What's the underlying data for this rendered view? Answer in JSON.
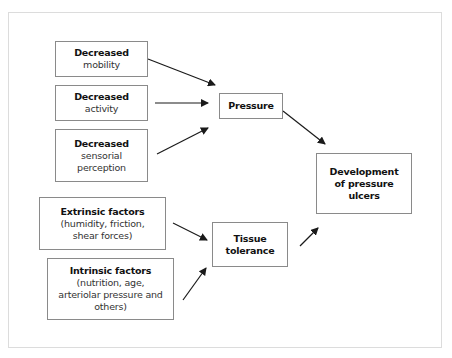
{
  "diagram": {
    "type": "flowchart",
    "title": "",
    "nodes": [
      {
        "id": "decreased-mobility",
        "title": "Decreased",
        "lines": [
          "mobility"
        ]
      },
      {
        "id": "decreased-activity",
        "title": "Decreased",
        "lines": [
          "activity"
        ]
      },
      {
        "id": "decreased-sensorial-perception",
        "title": "Decreased",
        "lines": [
          "sensorial",
          "perception"
        ]
      },
      {
        "id": "pressure",
        "title": "Pressure",
        "lines": []
      },
      {
        "id": "extrinsic-factors",
        "title": "Extrinsic factors",
        "lines": [
          "(humidity, friction,",
          "shear forces)"
        ]
      },
      {
        "id": "intrinsic-factors",
        "title": "Intrinsic factors",
        "lines": [
          "(nutrition, age,",
          "arteriolar pressure and",
          "others)"
        ]
      },
      {
        "id": "tissue-tolerance",
        "title": "Tissue",
        "lines": [
          "tolerance"
        ]
      },
      {
        "id": "development",
        "title": "Development",
        "lines": [
          "of pressure",
          "ulcers"
        ]
      }
    ],
    "edges": [
      {
        "from": "decreased-mobility",
        "to": "pressure"
      },
      {
        "from": "decreased-activity",
        "to": "pressure"
      },
      {
        "from": "decreased-sensorial-perception",
        "to": "pressure"
      },
      {
        "from": "pressure",
        "to": "development"
      },
      {
        "from": "extrinsic-factors",
        "to": "tissue-tolerance"
      },
      {
        "from": "intrinsic-factors",
        "to": "tissue-tolerance"
      },
      {
        "from": "tissue-tolerance",
        "to": "development"
      }
    ]
  },
  "colors": {
    "box_border": "#8a8a8a",
    "frame_border": "#dcdcdc",
    "arrow": "#1a1a1a",
    "text": "#111111"
  }
}
